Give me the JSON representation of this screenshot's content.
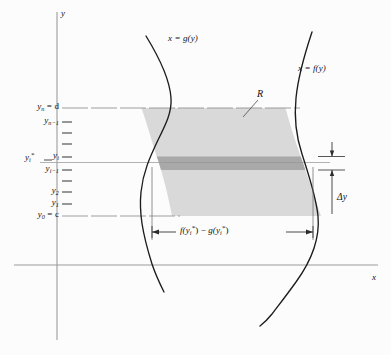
{
  "figure": {
    "type": "math-diagram",
    "axes": {
      "y_axis_label": "y",
      "x_axis_label": "x"
    },
    "curve_labels": {
      "left_curve": {
        "text": "x = g(y)"
      },
      "right_curve": {
        "text": "x = f(y)"
      }
    },
    "region_label": "R",
    "width_label": {
      "f_part": "f(y",
      "sub_i": "i",
      "star": "*",
      "close": ")",
      "minus": "−",
      "g_part": "g(y",
      "full": "f(y*i) − g(y*i)"
    },
    "delta_label": "Δy",
    "y_ticks": [
      {
        "id": "yn",
        "label": "y",
        "sub": "n",
        "suffix": " = d",
        "y": 108,
        "major": true
      },
      {
        "id": "yn1",
        "label": "y",
        "sub": "n−1",
        "suffix": "",
        "y": 122,
        "major": false
      },
      {
        "id": "t3",
        "label": "",
        "sub": "",
        "suffix": "",
        "y": 133,
        "major": false
      },
      {
        "id": "t4",
        "label": "",
        "sub": "",
        "suffix": "",
        "y": 144,
        "major": false
      },
      {
        "id": "yi",
        "label": "y",
        "sub": "i",
        "suffix": "",
        "y": 157,
        "major": false
      },
      {
        "id": "yi1",
        "label": "y",
        "sub": "i−1",
        "suffix": "",
        "y": 170,
        "major": false
      },
      {
        "id": "t7",
        "label": "",
        "sub": "",
        "suffix": "",
        "y": 181,
        "major": false
      },
      {
        "id": "y2",
        "label": "y",
        "sub": "2",
        "suffix": "",
        "y": 192,
        "major": false
      },
      {
        "id": "y1",
        "label": "y",
        "sub": "1",
        "suffix": "",
        "y": 204,
        "major": false
      },
      {
        "id": "y0",
        "label": "y",
        "sub": "0",
        "suffix": " = c",
        "y": 216,
        "major": true
      }
    ],
    "ystar_label": {
      "label": "y",
      "sub": "i",
      "star": "*"
    },
    "colors": {
      "region_fill": "#d9d9d9",
      "strip_fill": "#a9a9a9",
      "curve": "#1c1c1c",
      "axis": "#8d8d8d",
      "guide": "#9a9a9a",
      "background": "#fcfcfc"
    },
    "geometry": {
      "y_axis_x": 57,
      "x_axis_y": 265,
      "d_line_y": 108,
      "c_line_y": 216,
      "yi_line_y": 157,
      "yi1_line_y": 170
    }
  }
}
